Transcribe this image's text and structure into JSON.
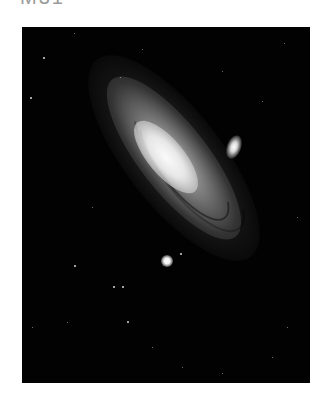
{
  "heading": {
    "text": "M31"
  },
  "photo": {
    "subject": "Andromeda Galaxy",
    "background_color": "#020202",
    "galaxy": {
      "core_color": "#f2f2f2",
      "disk_color": "#8a8a8a",
      "outer_color": "#3a3a3a",
      "tilt_deg": 52
    },
    "satellites": [
      {
        "name": "satellite-galaxy-upper-right",
        "x": 211,
        "y": 116,
        "w": 10,
        "h": 18
      },
      {
        "name": "satellite-galaxy-lower-left",
        "x": 145,
        "y": 234,
        "w": 9,
        "h": 9
      }
    ],
    "stars": [
      {
        "x": 21,
        "y": 30,
        "s": 2
      },
      {
        "x": 52,
        "y": 6,
        "s": 1
      },
      {
        "x": 98,
        "y": 50,
        "s": 1
      },
      {
        "x": 8,
        "y": 70,
        "s": 2
      },
      {
        "x": 120,
        "y": 22,
        "s": 1
      },
      {
        "x": 262,
        "y": 16,
        "s": 1
      },
      {
        "x": 240,
        "y": 74,
        "s": 1
      },
      {
        "x": 200,
        "y": 44,
        "s": 1
      },
      {
        "x": 52,
        "y": 238,
        "s": 2
      },
      {
        "x": 91,
        "y": 259,
        "s": 2
      },
      {
        "x": 100,
        "y": 259,
        "s": 2
      },
      {
        "x": 45,
        "y": 295,
        "s": 1
      },
      {
        "x": 105,
        "y": 294,
        "s": 2
      },
      {
        "x": 10,
        "y": 300,
        "s": 1
      },
      {
        "x": 158,
        "y": 226,
        "s": 2
      },
      {
        "x": 265,
        "y": 300,
        "s": 1
      },
      {
        "x": 250,
        "y": 330,
        "s": 1
      },
      {
        "x": 200,
        "y": 346,
        "s": 1
      },
      {
        "x": 275,
        "y": 190,
        "s": 1
      },
      {
        "x": 160,
        "y": 340,
        "s": 1
      },
      {
        "x": 130,
        "y": 320,
        "s": 1
      },
      {
        "x": 70,
        "y": 180,
        "s": 1
      }
    ]
  }
}
